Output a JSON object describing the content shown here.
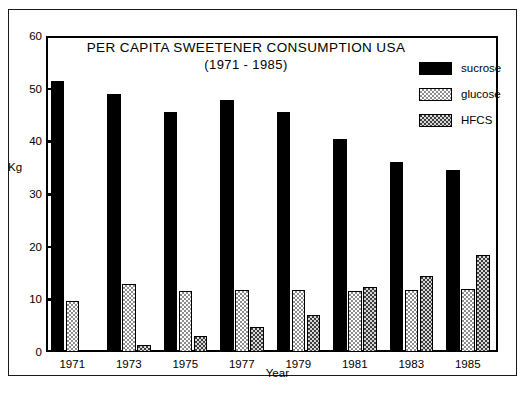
{
  "chart_data": {
    "type": "bar",
    "title": "PER CAPITA SWEETENER CONSUMPTION USA",
    "subtitle": "(1971 - 1985)",
    "xlabel": "Year",
    "ylabel": "Kg",
    "ylim": [
      0,
      60
    ],
    "yticks": [
      0,
      10,
      20,
      30,
      40,
      50,
      60
    ],
    "grid": false,
    "legend_position": "top-right",
    "categories": [
      "1971",
      "1973",
      "1975",
      "1977",
      "1979",
      "1981",
      "1983",
      "1985"
    ],
    "series": [
      {
        "name": "sucrose",
        "values": [
          51.5,
          49.0,
          45.5,
          47.8,
          45.5,
          40.5,
          36.0,
          34.5
        ]
      },
      {
        "name": "glucose",
        "values": [
          9.7,
          13.0,
          11.5,
          11.7,
          11.7,
          11.5,
          11.7,
          12.0
        ]
      },
      {
        "name": "HFCS",
        "values": [
          0.0,
          1.3,
          3.0,
          4.8,
          7.0,
          12.4,
          14.5,
          18.4
        ]
      }
    ]
  },
  "legend": {
    "items": [
      {
        "label": "sucrose",
        "pattern": "solid-black"
      },
      {
        "label": "glucose",
        "pattern": "light-stipple"
      },
      {
        "label": "HFCS",
        "pattern": "dark-crosshatch"
      }
    ]
  },
  "caption": {
    "text": ""
  }
}
